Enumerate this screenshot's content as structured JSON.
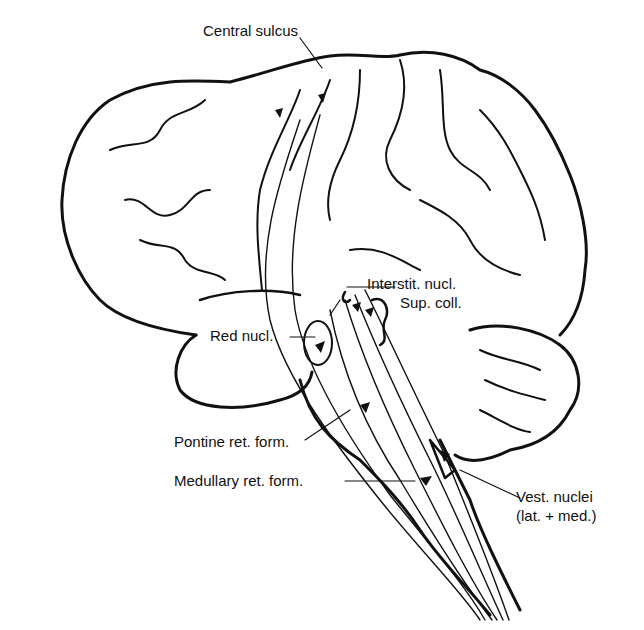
{
  "diagram": {
    "labels": {
      "central_sulcus": "Central sulcus",
      "interstit_nucl": "Interstit. nucl.",
      "sup_coll": "Sup. coll.",
      "red_nucl": "Red nucl.",
      "pontine": "Pontine ret. form.",
      "medullary": "Medullary ret. form.",
      "vest_nuclei_1": "Vest. nuclei",
      "vest_nuclei_2": "(lat. + med.)"
    },
    "colors": {
      "ink": "#111111",
      "background": "#ffffff"
    }
  }
}
